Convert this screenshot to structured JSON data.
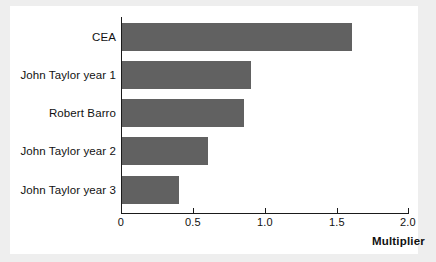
{
  "chart_data": {
    "type": "bar",
    "orientation": "horizontal",
    "title": "",
    "xlabel": "Multiplier",
    "ylabel": "",
    "categories": [
      "CEA",
      "John Taylor year 1",
      "Robert Barro",
      "John Taylor year 2",
      "John Taylor year 3"
    ],
    "values": [
      1.6,
      0.9,
      0.85,
      0.6,
      0.4
    ],
    "xlim": [
      0,
      2.0
    ],
    "xticks": [
      0,
      0.5,
      1.0,
      1.5,
      2.0
    ],
    "xticklabels": [
      "0",
      "0.5",
      "1.0",
      "1.5",
      "2.0"
    ],
    "grid": false,
    "legend": null,
    "bar_color": "#616161",
    "background_color": "#ffffff",
    "figure_background_color": "#eeeeee",
    "axis_color": "#1a1a1a"
  },
  "axis": {
    "x_title": "Multiplier"
  }
}
